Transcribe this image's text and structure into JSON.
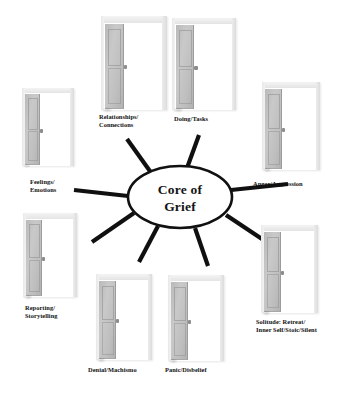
{
  "diagram": {
    "title": "Core of Grief",
    "core": {
      "line1": "Core of",
      "line2": "Grief",
      "shape": "ellipse",
      "fill": "#ffffff",
      "stroke": "#111111"
    },
    "background_color": "#ffffff",
    "spoke_color": "#101010",
    "door_color": "#c2c2c2",
    "door_frame_color": "#e6e6e6",
    "nodes": [
      {
        "id": "relationships-connections",
        "label": "Relationships/\nConnections",
        "icon": "door-ajar-icon",
        "position": "top-left"
      },
      {
        "id": "doing-tasks",
        "label": "Doing/Tasks",
        "icon": "door-ajar-icon",
        "position": "top-right"
      },
      {
        "id": "feelings-emotions",
        "label": "Feelings/\nEmotions",
        "icon": "door-ajar-icon",
        "position": "left-upper"
      },
      {
        "id": "anger-aggression",
        "label": "Anger/Aggression",
        "icon": "door-ajar-icon",
        "position": "right-upper"
      },
      {
        "id": "reporting-storytelling",
        "label": "Reporting/\nStorytelling",
        "icon": "door-ajar-icon",
        "position": "left-lower"
      },
      {
        "id": "solitude-retreat",
        "label": "Solitude: Retreat/\nInner Self/Stoic/Silent",
        "icon": "door-ajar-icon",
        "position": "right-lower"
      },
      {
        "id": "denial-machismo",
        "label": "Denial/Machismo",
        "icon": "door-ajar-icon",
        "position": "bottom-left"
      },
      {
        "id": "panic-disbelief",
        "label": "Panic/Disbelief",
        "icon": "door-ajar-icon",
        "position": "bottom-right"
      }
    ]
  }
}
